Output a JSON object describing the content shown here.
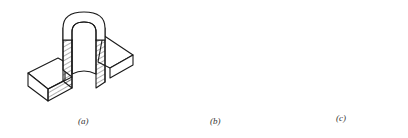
{
  "figure": {
    "panels": [
      {
        "id": "a",
        "caption": "(a)",
        "description": "Isometric section view of a flanged base with a vertical hollow cylinder, front quarter removed"
      },
      {
        "id": "b",
        "caption": "(b)",
        "description": "Isometric section view of base with hollow cylinder, half cut"
      },
      {
        "id": "c",
        "caption": "(c)",
        "description": "Isometric view of base with cylinder, partial section on right side"
      }
    ],
    "colors": {
      "line": "#1a1a1a",
      "background": "#ffffff",
      "caption": "#333333"
    }
  }
}
